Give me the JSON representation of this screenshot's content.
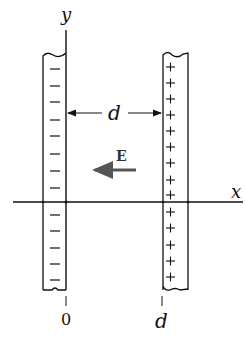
{
  "diagram": {
    "type": "parallel-plate-capacitor",
    "axes": {
      "y_label": "y",
      "x_label": "x"
    },
    "plates": [
      {
        "name": "left-plate",
        "charge_sign": "−",
        "charge_count": 13,
        "position_label": "0"
      },
      {
        "name": "right-plate",
        "charge_sign": "+",
        "charge_count": 14,
        "position_label": "d"
      }
    ],
    "separation_label": "d",
    "field": {
      "label": "E",
      "direction": "left",
      "color": "#555555"
    },
    "colors": {
      "stroke": "#111111",
      "background": "#ffffff"
    }
  }
}
